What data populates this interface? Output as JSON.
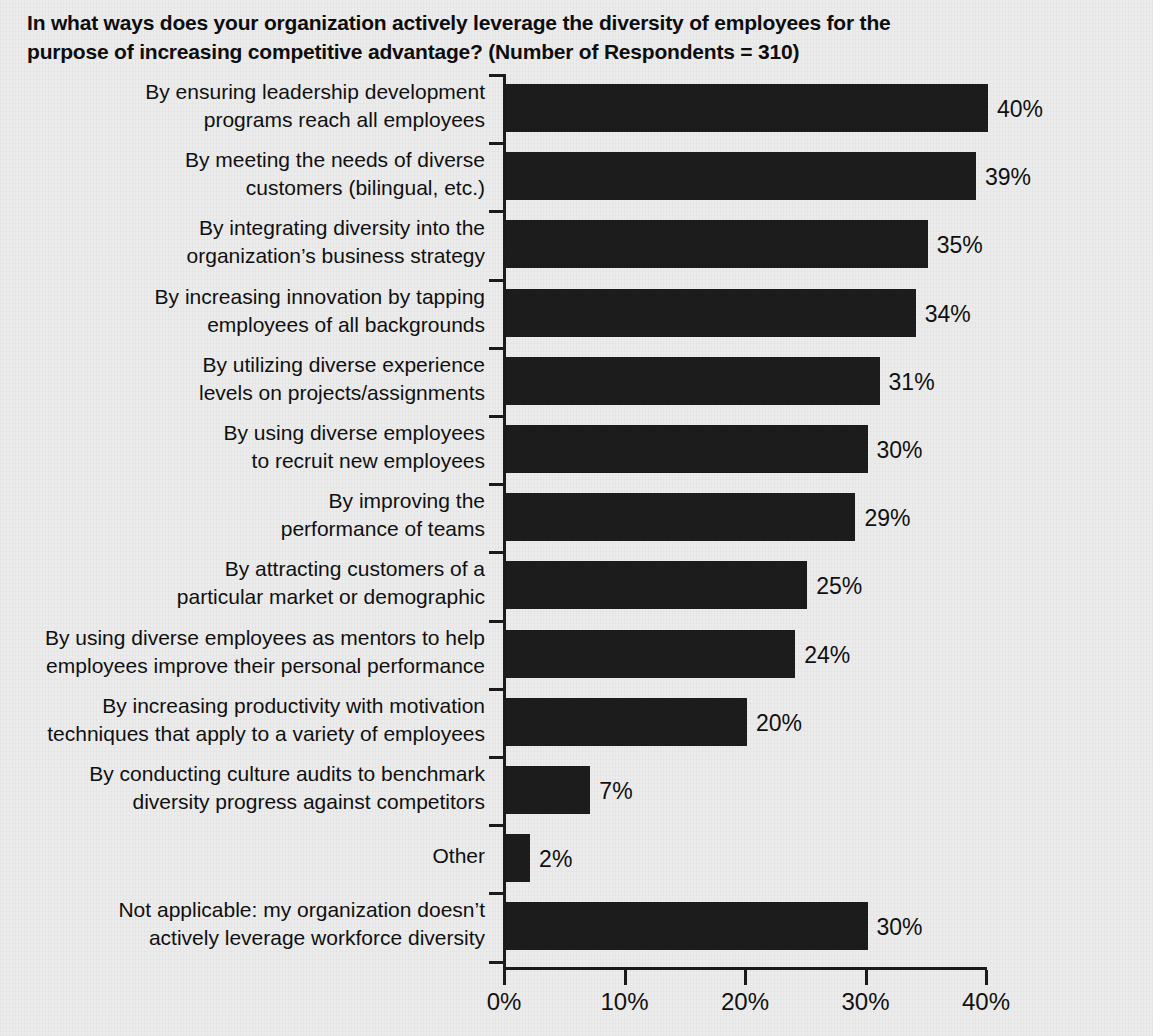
{
  "title": {
    "line1": "In what ways does your organization actively leverage the diversity of employees for the",
    "line2": "purpose of increasing competitive advantage? (Number of Respondents = 310)"
  },
  "chart_data": {
    "type": "bar",
    "orientation": "horizontal",
    "title": "In what ways does your organization actively leverage the diversity of employees for the purpose of increasing competitive advantage? (Number of Respondents = 310)",
    "respondents": 310,
    "xlabel": "",
    "ylabel": "",
    "xlim": [
      0,
      40
    ],
    "grid": false,
    "legend": null,
    "bar_color": "#1c1c1c",
    "background_color": "#ececec",
    "axis_color": "#1b1b1b",
    "xticks": [
      0,
      10,
      20,
      30,
      40
    ],
    "xtick_labels": [
      "0%",
      "10%",
      "20%",
      "30%",
      "40%"
    ],
    "categories": [
      "By ensuring leadership development\nprograms reach all employees",
      "By meeting the needs of diverse\ncustomers (bilingual, etc.)",
      "By integrating diversity into the\norganization’s business strategy",
      "By increasing innovation by tapping\nemployees of all backgrounds",
      "By utilizing diverse experience\nlevels on projects/assignments",
      "By using diverse employees\nto recruit new employees",
      "By improving the\nperformance of teams",
      "By attracting customers of a\nparticular market or demographic",
      "By using diverse employees as mentors to help\nemployees improve their personal performance",
      "By increasing productivity with motivation\ntechniques that apply to a variety of employees",
      "By conducting culture audits to benchmark\ndiversity progress against competitors",
      "Other",
      "Not applicable: my organization doesn’t\nactively leverage workforce diversity"
    ],
    "values": [
      40,
      39,
      35,
      34,
      31,
      30,
      29,
      25,
      24,
      20,
      7,
      2,
      30
    ],
    "value_labels": [
      "40%",
      "39%",
      "35%",
      "34%",
      "31%",
      "30%",
      "29%",
      "25%",
      "24%",
      "20%",
      "7%",
      "2%",
      "30%"
    ]
  }
}
